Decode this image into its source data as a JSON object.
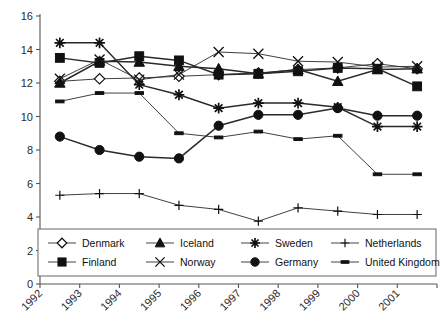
{
  "chart_data": {
    "type": "line",
    "title": "",
    "subtitle": "",
    "xlabel": "",
    "ylabel": "",
    "xlim": [
      1992,
      2002
    ],
    "ylim": [
      0,
      16
    ],
    "grid": false,
    "legend_position": "bottom-inside",
    "y_ticks": [
      0,
      2,
      4,
      6,
      8,
      10,
      12,
      14,
      16
    ],
    "y_tick_labels": [
      "0",
      "2",
      "4",
      "6",
      "8",
      "10",
      "12",
      "14",
      "16"
    ],
    "x_ticks": [
      1992,
      1993,
      1994,
      1995,
      1996,
      1997,
      1998,
      1999,
      2000,
      2001
    ],
    "x_tick_labels": [
      "1992",
      "1993",
      "1994",
      "1995",
      "1996",
      "1997",
      "1998",
      "1999",
      "2000",
      "2001"
    ],
    "x": [
      1992.5,
      1993.5,
      1994.5,
      1995.5,
      1996.5,
      1997.5,
      1998.5,
      1999.5,
      2000.5,
      2001.5
    ],
    "series": [
      {
        "name": "Denmark",
        "marker": "diamond-open",
        "values": [
          12.1,
          12.25,
          12.3,
          12.4,
          12.5,
          12.6,
          12.8,
          12.9,
          13.15,
          12.85
        ]
      },
      {
        "name": "Finland",
        "marker": "square-filled",
        "values": [
          13.5,
          13.2,
          13.6,
          13.35,
          12.5,
          12.55,
          12.7,
          12.9,
          12.85,
          11.8
        ]
      },
      {
        "name": "Iceland",
        "marker": "triangle-filled",
        "values": [
          12.0,
          13.3,
          13.25,
          13.0,
          12.85,
          12.55,
          12.8,
          12.1,
          12.8,
          12.85
        ]
      },
      {
        "name": "Norway",
        "marker": "x-open",
        "values": [
          12.25,
          13.4,
          12.2,
          12.5,
          13.85,
          13.75,
          13.3,
          13.25,
          12.95,
          13.0
        ]
      },
      {
        "name": "Sweden",
        "marker": "asterisk",
        "values": [
          14.4,
          14.4,
          11.9,
          11.3,
          10.5,
          10.8,
          10.8,
          10.55,
          9.4,
          9.4
        ]
      },
      {
        "name": "Germany",
        "marker": "circle-filled",
        "values": [
          8.8,
          8.0,
          7.6,
          7.5,
          9.45,
          10.1,
          10.1,
          10.5,
          10.05,
          10.05
        ]
      },
      {
        "name": "Netherlands",
        "marker": "plus",
        "values": [
          5.3,
          5.4,
          5.4,
          4.7,
          4.45,
          3.75,
          4.55,
          4.35,
          4.15,
          4.15
        ]
      },
      {
        "name": "United Kingdom",
        "marker": "dash",
        "values": [
          10.9,
          11.4,
          11.4,
          9.0,
          8.75,
          9.1,
          8.65,
          8.85,
          6.55,
          6.55
        ]
      }
    ]
  },
  "legend": {
    "entries": [
      {
        "label": "Denmark",
        "marker": "diamond-open"
      },
      {
        "label": "Iceland",
        "marker": "triangle-filled"
      },
      {
        "label": "Sweden",
        "marker": "asterisk"
      },
      {
        "label": "Netherlands",
        "marker": "plus"
      },
      {
        "label": "Finland",
        "marker": "square-filled"
      },
      {
        "label": "Norway",
        "marker": "x-open"
      },
      {
        "label": "Germany",
        "marker": "circle-filled"
      },
      {
        "label": "United Kingdom",
        "marker": "dash"
      }
    ]
  },
  "colors": {
    "line": "#2a2a2a",
    "axis": "#555555",
    "text": "#1a1a1a",
    "background": "#ffffff"
  }
}
